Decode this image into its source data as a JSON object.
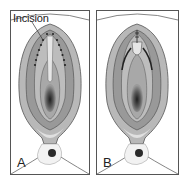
{
  "figure": {
    "panels": [
      {
        "id": "A",
        "label": "A",
        "annotation": "Incision",
        "state": "open-incision"
      },
      {
        "id": "B",
        "label": "B",
        "state": "sutured"
      }
    ],
    "colors": {
      "frame": "#555555",
      "outer_tissue": "#b5b5b5",
      "mid_tissue": "#8f8f8f",
      "inner_tissue": "#c8c8c8",
      "dark_center": "#2e2e2e",
      "highlight": "#e4e4e4",
      "incision_dots": "#222222"
    }
  }
}
